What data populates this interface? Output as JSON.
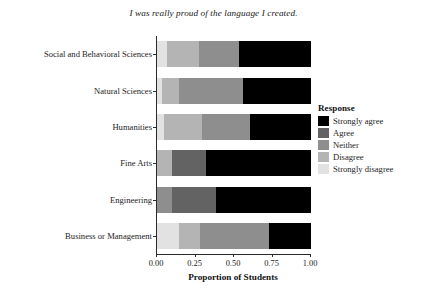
{
  "chart_data": {
    "type": "bar",
    "orientation": "horizontal",
    "stacked": true,
    "normalized": true,
    "title": "I was really proud of the language I created.",
    "xlabel": "Proportion of Students",
    "ylabel": "",
    "xlim": [
      0,
      1
    ],
    "xticks": [
      0,
      0.25,
      0.5,
      0.75,
      1
    ],
    "xticklabels": [
      "0.00",
      "0.25",
      "0.50",
      "0.75",
      "1.00"
    ],
    "grid": false,
    "legend_title": "Response",
    "legend_position": "right",
    "categories": [
      "Social and Behavioral Sciences",
      "Natural Sciences",
      "Humanities",
      "Fine Arts",
      "Engineering",
      "Business or Management"
    ],
    "series": [
      {
        "name": "Strongly disagree",
        "color": "#e2e2e2",
        "values": [
          0.065,
          0.03,
          0.045,
          0.0,
          0.0,
          0.14
        ]
      },
      {
        "name": "Disagree",
        "color": "#b4b4b4",
        "values": [
          0.21,
          0.11,
          0.25,
          0.1,
          0.0,
          0.14
        ]
      },
      {
        "name": "Neither",
        "color": "#8e8e8e",
        "values": [
          0.26,
          0.42,
          0.31,
          0.0,
          0.1,
          0.45
        ]
      },
      {
        "name": "Agree",
        "color": "#636363",
        "values": [
          0.0,
          0.0,
          0.0,
          0.22,
          0.28,
          0.0
        ]
      },
      {
        "name": "Strongly agree",
        "color": "#000000",
        "values": [
          0.465,
          0.44,
          0.4,
          0.68,
          0.62,
          0.27
        ]
      }
    ],
    "legend_entries": [
      {
        "label": "Strongly agree",
        "color": "#000000"
      },
      {
        "label": "Agree",
        "color": "#636363"
      },
      {
        "label": "Neither",
        "color": "#8e8e8e"
      },
      {
        "label": "Disagree",
        "color": "#b4b4b4"
      },
      {
        "label": "Strongly disagree",
        "color": "#e2e2e2"
      }
    ]
  },
  "colors": {
    "axis": "#2a2a2a",
    "text": "#1d1d1d",
    "background": "#ffffff"
  }
}
